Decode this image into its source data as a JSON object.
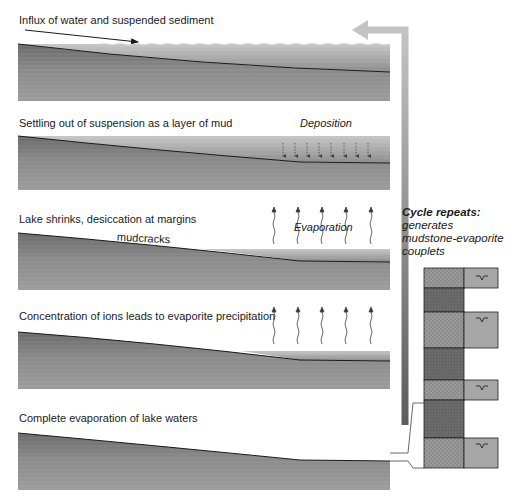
{
  "panels": [
    {
      "id": "influx",
      "caption": "Influx of water and suspended sediment"
    },
    {
      "id": "settling",
      "caption": "Settling out of suspension as a layer of mud",
      "annotation": "Deposition"
    },
    {
      "id": "shrinks",
      "caption": "Lake shrinks, desiccation at margins",
      "annotation": "Evaporation",
      "sublabel": "mudcracks"
    },
    {
      "id": "concentration",
      "caption": "Concentration of ions leads to evaporite precipitation"
    },
    {
      "id": "complete",
      "caption": "Complete evaporation of lake waters"
    }
  ],
  "cycle": {
    "title": "Cycle repeats:",
    "line1": "generates",
    "line2": "mudstone-evaporite",
    "line3": "couplets"
  },
  "column": {
    "layers": [
      "evaporite",
      "mudstone",
      "evaporite",
      "mudstone",
      "evaporite",
      "mudstone",
      "evaporite"
    ],
    "evaporite_symbol": "‘V’"
  },
  "colors": {
    "sediment_dark": "#6e6e6e",
    "sediment_light": "#a8a8a8",
    "water": "#9a9a9a",
    "arrow_top": "#c4c4c4",
    "arrow_bottom": "#5c5c5c",
    "evaporite": "#a6a6a6",
    "mudstone": "#6a6a6a"
  }
}
